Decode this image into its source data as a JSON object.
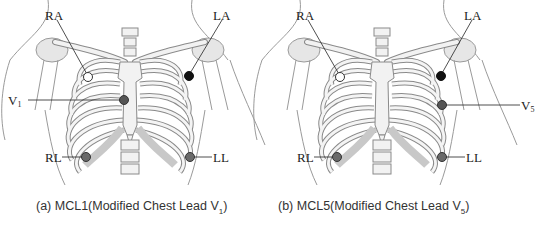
{
  "panels": [
    {
      "id": "a",
      "caption_prefix": "(a) MCL1(Modified Chest Lead V",
      "caption_sub": "1",
      "caption_suffix": ")",
      "electrodes": [
        {
          "label": "RA",
          "fill": "#ffffff"
        },
        {
          "label": "LA",
          "fill": "#111111"
        },
        {
          "label": "V",
          "sub": "1",
          "fill": "#555555"
        },
        {
          "label": "RL",
          "fill": "#6a6a6a"
        },
        {
          "label": "LL",
          "fill": "#6a6a6a"
        }
      ]
    },
    {
      "id": "b",
      "caption_prefix": "(b) MCL5(Modified Chest Lead V",
      "caption_sub": "5",
      "caption_suffix": ")",
      "electrodes": [
        {
          "label": "RA",
          "fill": "#ffffff"
        },
        {
          "label": "LA",
          "fill": "#111111"
        },
        {
          "label": "V",
          "sub": "5",
          "fill": "#555555"
        },
        {
          "label": "RL",
          "fill": "#6a6a6a"
        },
        {
          "label": "LL",
          "fill": "#6a6a6a"
        }
      ]
    }
  ],
  "colors": {
    "outline": "#8a8a8a",
    "bone_fill": "#f2f2f2",
    "cartilage_fill": "#dcdcdc",
    "skin_line": "#9a9a9a"
  }
}
